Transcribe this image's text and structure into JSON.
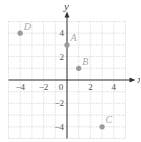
{
  "chart_data": {
    "type": "scatter",
    "title": "",
    "xlabel": "x",
    "ylabel": "y",
    "xlim": [
      -5,
      5
    ],
    "ylim": [
      -5,
      5
    ],
    "grid": true,
    "x_ticks": [
      -4,
      -2,
      0,
      2,
      4
    ],
    "x_tick_labels": [
      "−4",
      "−2",
      "0",
      "2",
      "4"
    ],
    "y_ticks": [
      -4,
      -2,
      2,
      4
    ],
    "y_tick_labels": [
      "−4",
      "−2",
      "2",
      "4"
    ],
    "points": [
      {
        "label": "A",
        "x": 0,
        "y": 3
      },
      {
        "label": "B",
        "x": 1,
        "y": 1
      },
      {
        "label": "C",
        "x": 3,
        "y": -4
      },
      {
        "label": "D",
        "x": -4,
        "y": 4
      }
    ],
    "colors": {
      "grid": "#d8d8d8",
      "axis": "#333333",
      "point": "#9a9a9a",
      "point_label": "#aaaaaa"
    }
  }
}
